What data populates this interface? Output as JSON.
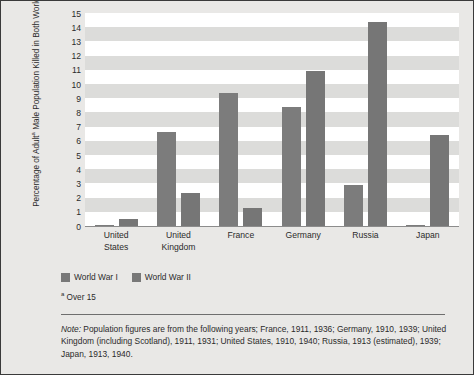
{
  "chart_data": {
    "type": "bar",
    "title": "",
    "xlabel": "",
    "ylabel": "Percentage of Adultᵃ Male Population Killed in Both World Wars",
    "categories": [
      "United States",
      "United Kingdom",
      "France",
      "Germany",
      "Russia",
      "Japan"
    ],
    "series": [
      {
        "name": "World War I",
        "values": [
          0.1,
          6.6,
          9.4,
          8.4,
          2.9,
          0.05
        ],
        "color": "#7c7c7c"
      },
      {
        "name": "World War II",
        "values": [
          0.5,
          2.3,
          1.3,
          10.9,
          14.4,
          6.4
        ],
        "color": "#767676"
      }
    ],
    "ylim": [
      0,
      15
    ],
    "ytick_step": 1,
    "yticks": [
      "15",
      "14",
      "13",
      "12",
      "11",
      "10",
      "9",
      "8",
      "7",
      "6",
      "5",
      "4",
      "3",
      "2",
      "1",
      "0"
    ],
    "grid": "horizontal-bands",
    "legend_position": "below-left"
  },
  "axis": {
    "y_title_line1": "Percentage of Adult",
    "y_title_sup": "a",
    "y_title_line2": " Male Population Killed in Both World Wars"
  },
  "legend": {
    "items": [
      {
        "label": "World War I",
        "color": "#787878"
      },
      {
        "label": "World War II",
        "color": "#787878"
      }
    ]
  },
  "footnote": {
    "marker": "a",
    "text": " Over 15"
  },
  "note": {
    "label": "Note:",
    "text": " Population figures are from the following years; France, 1911, 1936; Germany, 1910, 1939; United Kingdom (including Scotland), 1911, 1931; United States, 1910, 1940; Russia, 1913 (estimated), 1939; Japan, 1913, 1940."
  }
}
